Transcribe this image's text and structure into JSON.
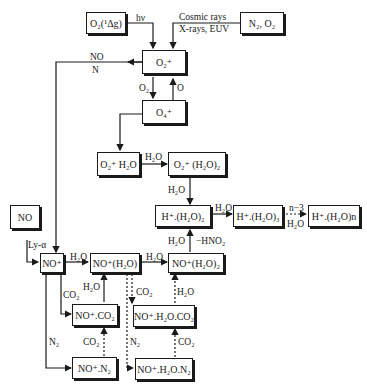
{
  "diagram": {
    "type": "ion chemistry reaction scheme",
    "boxes": {
      "o2_delta": "O₂(¹Δg)",
      "n2_o2": "N₂, O₂",
      "o2_plus": "O₂⁺",
      "o4_plus": "O₄⁺",
      "o2_h2o": "O₂⁺ H₂O",
      "o2_h2o2": "O₂⁺ (H₂O)₂",
      "h_h2o2": "H⁺.(H₂O)₂",
      "h_h2o3": "H⁺.(H₂O)₃",
      "h_h2on": "H⁺.(H₂O)n",
      "no": "NO",
      "no_plus": "NO⁺",
      "no_h2o": "NO⁺(H₂O)",
      "no_h2o2": "NO⁺(H₂O)₂",
      "no_co2": "NO⁺.CO₂",
      "no_h2o_co2": "NO⁺.H₂O.CO₂",
      "no_n2": "NO⁺.N₂",
      "no_h2o_n2": "NO⁺.H₂O.N₂"
    },
    "labels": {
      "hv": "hν",
      "cosmic": "Cosmic rays",
      "xrays": "X-rays, EUV",
      "no": "NO",
      "n": "N",
      "o2": "O₂",
      "o": "O",
      "h2o_a": "H₂O",
      "h2o_b": "H₂O",
      "h2o_c": "H₂O",
      "n3": "n−3",
      "h2o_d": "H₂O",
      "h2o_e": "H₂O",
      "hno2": "−HNO₂",
      "lya": "Ly-α",
      "h2o_f": "H₂O",
      "h2o_g": "H₂O",
      "co2_a": "CO₂",
      "h2o_h": "H₂O",
      "co2_b": "CO₂",
      "h2o_i": "H₂O",
      "n2_a": "N₂",
      "co2_c": "CO₂",
      "n2_b": "N₂",
      "co2_d": "CO₂"
    }
  }
}
